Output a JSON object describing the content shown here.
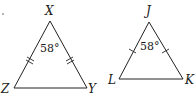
{
  "diagram": {
    "triangles": [
      {
        "name": "XYZ",
        "vertices": {
          "apex": "X",
          "bottom_left": "Z",
          "bottom_right": "Y"
        },
        "apex_angle": "58°",
        "congruence_marks": "double"
      },
      {
        "name": "JKL",
        "vertices": {
          "apex": "J",
          "bottom_left": "L",
          "bottom_right": "K"
        },
        "apex_angle": "58°",
        "congruence_marks": "single"
      }
    ],
    "colors": {
      "stroke": "#222222",
      "background": "#ffffff"
    }
  }
}
